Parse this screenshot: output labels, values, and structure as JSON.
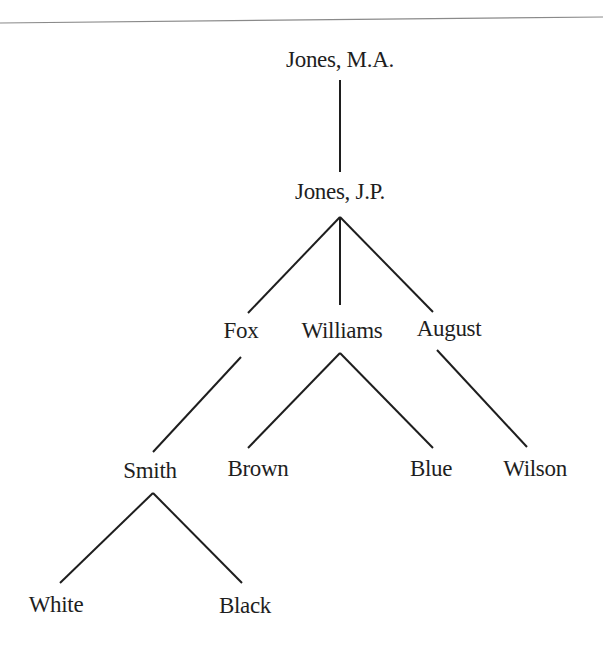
{
  "diagram": {
    "type": "tree",
    "nodes": [
      {
        "id": "jones_ma",
        "label": "Jones, M.A.",
        "x": 340,
        "y": 60,
        "parent": null
      },
      {
        "id": "jones_jp",
        "label": "Jones, J.P.",
        "x": 340,
        "y": 192,
        "parent": "jones_ma"
      },
      {
        "id": "fox",
        "label": "Fox",
        "x": 241,
        "y": 331,
        "parent": "jones_jp"
      },
      {
        "id": "williams",
        "label": "Williams",
        "x": 342,
        "y": 331,
        "parent": "jones_jp"
      },
      {
        "id": "august",
        "label": "August",
        "x": 449,
        "y": 329,
        "parent": "jones_jp"
      },
      {
        "id": "smith",
        "label": "Smith",
        "x": 150,
        "y": 471,
        "parent": "fox"
      },
      {
        "id": "brown",
        "label": "Brown",
        "x": 258,
        "y": 469,
        "parent": "williams"
      },
      {
        "id": "blue",
        "label": "Blue",
        "x": 431,
        "y": 469,
        "parent": "williams"
      },
      {
        "id": "wilson",
        "label": "Wilson",
        "x": 535,
        "y": 469,
        "parent": "august"
      },
      {
        "id": "white",
        "label": "White",
        "x": 56,
        "y": 605,
        "parent": "smith"
      },
      {
        "id": "black",
        "label": "Black",
        "x": 245,
        "y": 606,
        "parent": "smith"
      }
    ],
    "edges": [
      {
        "from": "jones_ma",
        "to": "jones_jp",
        "x1": 340,
        "y1": 80,
        "x2": 340,
        "y2": 172
      },
      {
        "from": "jones_jp",
        "to": "fox",
        "x1": 340,
        "y1": 217,
        "x2": 248,
        "y2": 313
      },
      {
        "from": "jones_jp",
        "to": "williams",
        "x1": 340,
        "y1": 217,
        "x2": 340,
        "y2": 305
      },
      {
        "from": "jones_jp",
        "to": "august",
        "x1": 340,
        "y1": 217,
        "x2": 433,
        "y2": 312
      },
      {
        "from": "fox",
        "to": "smith",
        "x1": 241,
        "y1": 357,
        "x2": 153,
        "y2": 452
      },
      {
        "from": "williams",
        "to": "brown",
        "x1": 340,
        "y1": 353,
        "x2": 248,
        "y2": 448
      },
      {
        "from": "williams",
        "to": "blue",
        "x1": 340,
        "y1": 353,
        "x2": 433,
        "y2": 448
      },
      {
        "from": "august",
        "to": "wilson",
        "x1": 437,
        "y1": 350,
        "x2": 527,
        "y2": 447
      },
      {
        "from": "smith",
        "to": "white",
        "x1": 153,
        "y1": 493,
        "x2": 60,
        "y2": 583
      },
      {
        "from": "smith",
        "to": "black",
        "x1": 153,
        "y1": 493,
        "x2": 242,
        "y2": 583
      }
    ],
    "colors": {
      "line": "#1e1e1e",
      "text": "#1e1e1e",
      "rule": "#8a8a8a",
      "background": "#ffffff"
    }
  }
}
